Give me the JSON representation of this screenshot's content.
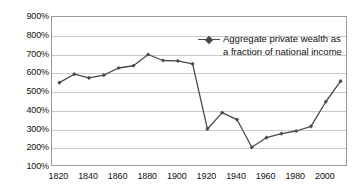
{
  "chart_data": {
    "type": "line",
    "title": "",
    "subtitle": "",
    "xlabel": "",
    "ylabel": "",
    "xlim": [
      1815,
      2015
    ],
    "ylim": [
      100,
      900
    ],
    "y_tick_labels": [
      "100%",
      "200%",
      "300%",
      "400%",
      "500%",
      "600%",
      "700%",
      "800%",
      "900%"
    ],
    "y_ticks": [
      100,
      200,
      300,
      400,
      500,
      600,
      700,
      800,
      900
    ],
    "x_tick_labels": [
      "1820",
      "1840",
      "1860",
      "1880",
      "1900",
      "1920",
      "1940",
      "1960",
      "1980",
      "2000"
    ],
    "x_ticks": [
      1820,
      1840,
      1860,
      1880,
      1900,
      1920,
      1940,
      1960,
      1980,
      2000
    ],
    "grid": "horizontal",
    "legend_position": "inside-top-right",
    "series": [
      {
        "name": "Aggregate private wealth as a fraction of national income",
        "marker": "diamond",
        "color": "#4a4a4a",
        "x": [
          1820,
          1830,
          1840,
          1850,
          1860,
          1870,
          1880,
          1890,
          1900,
          1910,
          1920,
          1930,
          1940,
          1950,
          1960,
          1970,
          1980,
          1990,
          2000,
          2010
        ],
        "values": [
          550,
          595,
          575,
          590,
          628,
          640,
          700,
          668,
          666,
          650,
          303,
          390,
          353,
          205,
          257,
          278,
          292,
          317,
          448,
          558
        ]
      }
    ],
    "legend": [
      {
        "label_line_1": "Aggregate private wealth",
        "label_line_2": "as a fraction of national",
        "label_line_3": "income",
        "label_full": "Aggregate private wealth as a fraction of national income",
        "swatch_color": "#4a4a4a"
      }
    ],
    "colors": {
      "series_line": "#4a4a4a",
      "gridline": "#c9c9c9",
      "axis_border": "#9a9a9a",
      "text": "#111111",
      "background": "#ffffff"
    }
  }
}
